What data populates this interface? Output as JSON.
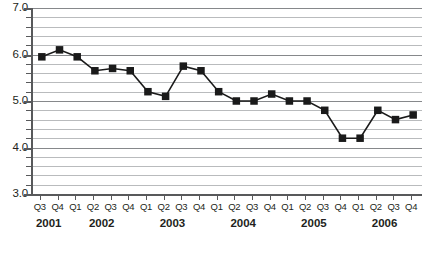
{
  "chart_data": {
    "type": "line",
    "title": "",
    "subtitle": "",
    "xlabel": "",
    "ylabel": "",
    "ylim": [
      3.0,
      7.0
    ],
    "y_major_ticks": [
      "3.0",
      "4.0",
      "5.0",
      "6.0",
      "7.0"
    ],
    "y_major_values": [
      3.0,
      4.0,
      5.0,
      6.0,
      7.0
    ],
    "y_minor_step": 0.2,
    "grid": true,
    "legend": "none",
    "marker": "square",
    "categories": [
      "Q3",
      "Q4",
      "Q1",
      "Q2",
      "Q3",
      "Q4",
      "Q1",
      "Q2",
      "Q3",
      "Q4",
      "Q1",
      "Q2",
      "Q3",
      "Q4",
      "Q1",
      "Q2",
      "Q3",
      "Q4",
      "Q1",
      "Q2",
      "Q3",
      "Q4"
    ],
    "values": [
      5.95,
      6.1,
      5.95,
      5.65,
      5.7,
      5.65,
      5.2,
      5.1,
      5.75,
      5.65,
      5.2,
      5.0,
      5.0,
      5.15,
      5.0,
      5.0,
      4.8,
      4.2,
      4.2,
      4.8,
      4.6,
      4.7
    ],
    "year_groups": [
      {
        "label": "2001",
        "start_index": 0,
        "count": 2
      },
      {
        "label": "2002",
        "start_index": 2,
        "count": 4
      },
      {
        "label": "2003",
        "start_index": 6,
        "count": 4
      },
      {
        "label": "2004",
        "start_index": 10,
        "count": 4
      },
      {
        "label": "2005",
        "start_index": 14,
        "count": 4
      },
      {
        "label": "2006",
        "start_index": 18,
        "count": 4
      }
    ],
    "colors": {
      "line": "#1a1a1a",
      "marker": "#1a1a1a",
      "gridline_minor": "#b9bbbd",
      "gridline_major": "#86888b",
      "axis": "#58595b",
      "text": "#231f20",
      "background": "#ffffff"
    }
  }
}
